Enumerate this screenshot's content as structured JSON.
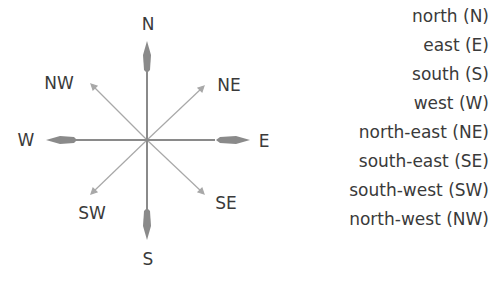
{
  "compass": {
    "labels": {
      "n": "N",
      "e": "E",
      "s": "S",
      "w": "W",
      "ne": "NE",
      "se": "SE",
      "sw": "SW",
      "nw": "NW"
    },
    "colors": {
      "main_arrow": "#8a8a8a",
      "diagonal_arrow": "#a8a8a8",
      "text": "#3a3a3a"
    }
  },
  "legend": {
    "items": [
      "north (N)",
      "east (E)",
      "south (S)",
      "west (W)",
      "north-east (NE)",
      "south-east (SE)",
      "south-west (SW)",
      "north-west (NW)"
    ]
  }
}
